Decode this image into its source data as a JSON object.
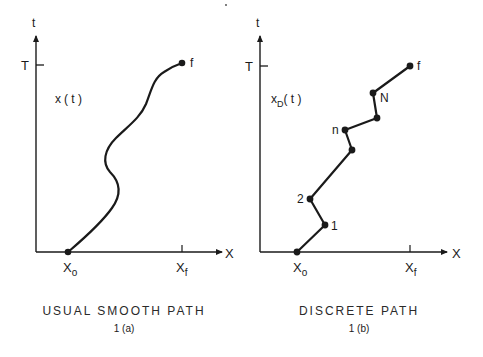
{
  "figure_a": {
    "t_axis_label": "t",
    "x_axis_label": "X",
    "T_label": "T",
    "curve_label_main": "x",
    "curve_label_arg": "( t )",
    "x0_label_main": "X",
    "x0_label_sub": "o",
    "xf_label_main": "X",
    "xf_label_sub": "f",
    "end_label": "f",
    "caption": "USUAL SMOOTH PATH",
    "sub_caption": "1 (a)"
  },
  "figure_b": {
    "t_axis_label": "t",
    "x_axis_label": "X",
    "T_label": "T",
    "curve_label_main": "x",
    "curve_label_sub": "D",
    "curve_label_arg": "( t )",
    "x0_label_main": "X",
    "x0_label_sub": "o",
    "xf_label_main": "X",
    "xf_label_sub": "f",
    "point_labels": [
      "1",
      "2",
      "n",
      "N",
      "f"
    ],
    "caption": "DISCRETE PATH",
    "sub_caption": "1 (b)"
  },
  "stray_mark": "·"
}
